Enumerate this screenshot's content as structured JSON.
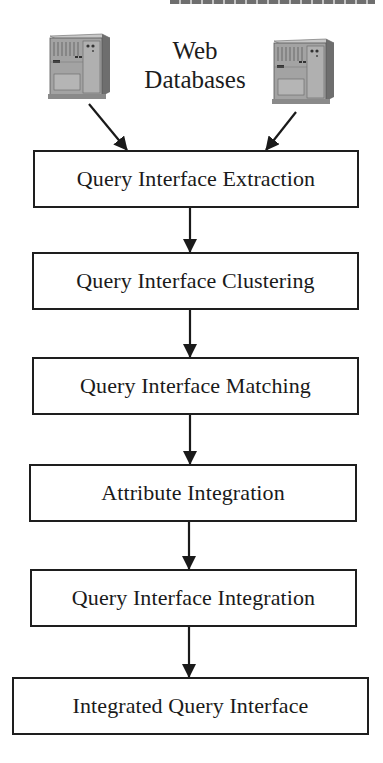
{
  "diagram": {
    "type": "flowchart",
    "direction": "top-to-bottom",
    "sources": {
      "label_line1": "Web",
      "label_line2": "Databases",
      "icons": [
        "server-icon",
        "server-icon"
      ]
    },
    "steps": [
      {
        "id": "step1",
        "label": "Query Interface Extraction"
      },
      {
        "id": "step2",
        "label": "Query Interface Clustering"
      },
      {
        "id": "step3",
        "label": "Query Interface Matching"
      },
      {
        "id": "step4",
        "label": "Attribute Integration"
      },
      {
        "id": "step5",
        "label": "Query Interface Integration"
      },
      {
        "id": "step6",
        "label": "Integrated Query Interface"
      }
    ],
    "edges": [
      {
        "from": "left-server",
        "to": "step1"
      },
      {
        "from": "right-server",
        "to": "step1"
      },
      {
        "from": "step1",
        "to": "step2"
      },
      {
        "from": "step2",
        "to": "step3"
      },
      {
        "from": "step3",
        "to": "step4"
      },
      {
        "from": "step4",
        "to": "step5"
      },
      {
        "from": "step5",
        "to": "step6"
      }
    ],
    "colors": {
      "stroke": "#1e1e1e",
      "background": "#ffffff",
      "server_body": "#9a9a9a"
    }
  }
}
